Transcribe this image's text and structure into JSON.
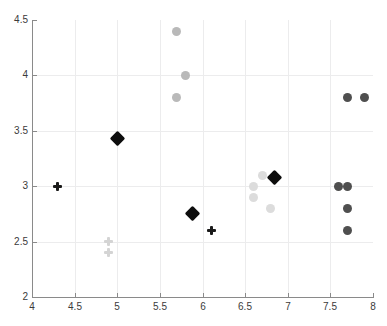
{
  "chart_data": {
    "type": "scatter",
    "title": "",
    "xlabel": "",
    "ylabel": "",
    "xlim": [
      4,
      8
    ],
    "ylim": [
      2,
      4.5
    ],
    "grid": true,
    "legend": "none",
    "xticks": [
      "4",
      "4.5",
      "5",
      "5.5",
      "6",
      "6.5",
      "7",
      "7.5",
      "8"
    ],
    "xtick_values": [
      4,
      4.5,
      5,
      5.5,
      6,
      6.5,
      7,
      7.5,
      8
    ],
    "yticks": [
      "2",
      "2.5",
      "3",
      "3.5",
      "4",
      "4.5"
    ],
    "ytick_values": [
      2,
      2.5,
      3,
      3.5,
      4,
      4.5
    ],
    "series": [
      {
        "name": "black-diamonds",
        "marker": "diamond",
        "color": "#0d0d0d",
        "size": 11,
        "points": [
          {
            "x": 5.0,
            "y": 3.43
          },
          {
            "x": 5.88,
            "y": 2.75
          },
          {
            "x": 6.85,
            "y": 3.08
          }
        ]
      },
      {
        "name": "black-plus",
        "marker": "plus",
        "color": "#1a1a1a",
        "size": 9,
        "points": [
          {
            "x": 4.3,
            "y": 3.0
          },
          {
            "x": 6.1,
            "y": 2.6
          }
        ]
      },
      {
        "name": "light-grey-plus",
        "marker": "plus",
        "color": "#d4d4d4",
        "size": 9,
        "points": [
          {
            "x": 4.9,
            "y": 2.5
          },
          {
            "x": 4.9,
            "y": 2.4
          }
        ]
      },
      {
        "name": "medium-grey-circles",
        "marker": "circle",
        "color": "#b9b9b9",
        "size": 9,
        "points": [
          {
            "x": 5.7,
            "y": 4.4
          },
          {
            "x": 5.8,
            "y": 4.0
          },
          {
            "x": 5.7,
            "y": 3.8
          }
        ]
      },
      {
        "name": "pale-grey-circles",
        "marker": "circle",
        "color": "#dcdcdc",
        "size": 9,
        "points": [
          {
            "x": 6.6,
            "y": 3.0
          },
          {
            "x": 6.6,
            "y": 2.9
          },
          {
            "x": 6.7,
            "y": 3.1
          },
          {
            "x": 6.8,
            "y": 2.8
          }
        ]
      },
      {
        "name": "dark-grey-circles",
        "marker": "circle",
        "color": "#4f4f4f",
        "size": 9,
        "points": [
          {
            "x": 7.7,
            "y": 3.8
          },
          {
            "x": 7.9,
            "y": 3.8
          },
          {
            "x": 7.6,
            "y": 3.0
          },
          {
            "x": 7.7,
            "y": 3.0
          },
          {
            "x": 7.7,
            "y": 2.8
          },
          {
            "x": 7.7,
            "y": 2.6
          }
        ]
      }
    ]
  },
  "style": {
    "axis_color": "#8a8a8a",
    "grid_color": "#ececed",
    "tick_label_color": "#3b3b3b",
    "background": "#ffffff"
  }
}
